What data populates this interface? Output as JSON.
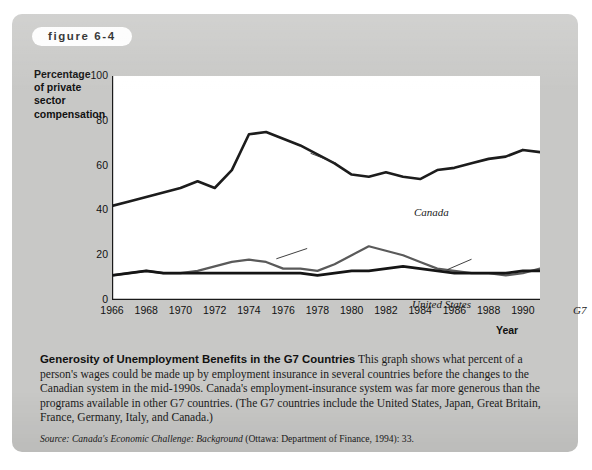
{
  "figure": {
    "badge_label": "figure 6-4"
  },
  "chart_data": {
    "type": "line",
    "title": "",
    "xlabel": "Year",
    "ylabel": "Percentage of private sector compensation",
    "ylabel_lines": [
      "Percentage",
      "of private",
      "sector",
      "compensation"
    ],
    "xlim": [
      1966,
      1991
    ],
    "ylim": [
      0,
      100
    ],
    "y_ticks": [
      0,
      20,
      40,
      60,
      80,
      100
    ],
    "y_minor_ticks": [
      10,
      30,
      50,
      70,
      90
    ],
    "x_ticks": [
      1966,
      1968,
      1970,
      1972,
      1974,
      1976,
      1978,
      1980,
      1982,
      1984,
      1986,
      1988,
      1990
    ],
    "x_minor_ticks": [
      1967,
      1969,
      1971,
      1973,
      1975,
      1977,
      1979,
      1981,
      1983,
      1985,
      1987,
      1989,
      1991
    ],
    "grid": false,
    "legend_position": "inline-annotations",
    "x": [
      1966,
      1967,
      1968,
      1969,
      1970,
      1971,
      1972,
      1973,
      1974,
      1975,
      1976,
      1977,
      1978,
      1979,
      1980,
      1981,
      1982,
      1983,
      1984,
      1985,
      1986,
      1987,
      1988,
      1989,
      1990,
      1991
    ],
    "series": [
      {
        "name": "Canada",
        "color": "#1c1c1c",
        "width": 2.6,
        "label_x": 1978,
        "label_y": 68,
        "values": [
          42,
          44,
          46,
          48,
          50,
          53,
          50,
          58,
          74,
          75,
          72,
          69,
          65,
          61,
          56,
          55,
          57,
          55,
          54,
          58,
          59,
          61,
          63,
          64,
          67,
          66
        ]
      },
      {
        "name": "United States",
        "color": "#5a5a5a",
        "width": 2.2,
        "label_x": 1976,
        "label_y": 26,
        "values": [
          11,
          12,
          13,
          12,
          12,
          13,
          15,
          17,
          18,
          17,
          14,
          14,
          13,
          16,
          20,
          24,
          22,
          20,
          17,
          14,
          13,
          12,
          12,
          11,
          12,
          14
        ]
      },
      {
        "name": "G7",
        "color": "#151515",
        "width": 2.6,
        "label_x": 1987,
        "label_y": 20,
        "values": [
          11,
          12,
          13,
          12,
          12,
          12,
          12,
          12,
          12,
          12,
          12,
          12,
          11,
          12,
          13,
          13,
          14,
          15,
          14,
          13,
          12,
          12,
          12,
          12,
          13,
          13
        ]
      }
    ]
  },
  "caption": {
    "title": "Generosity of Unemployment Benefits in the G7 Countries",
    "body": "This graph shows what percent of a person's wages could be made up by employment insurance in several countries before the changes to the Canadian system in the mid-1990s. Canada's employment-insurance system was far more generous than the programs available in other G7 countries. (The G7 countries include the United States, Japan, Great Britain, France, Germany, Italy, and Canada.)",
    "source_prefix": "Source:",
    "source_title": "Canada's Economic Challenge: Background",
    "source_rest": "(Ottawa: Department of Finance, 1994): 33."
  },
  "colors": {
    "panel_background": "#c8c8c6",
    "plot_background": "#ffffff",
    "axis": "#1a1a1a",
    "canada_line": "#1c1c1c",
    "us_line": "#5a5a5a",
    "g7_line": "#151515",
    "badge_background": "#fdfdfd"
  }
}
